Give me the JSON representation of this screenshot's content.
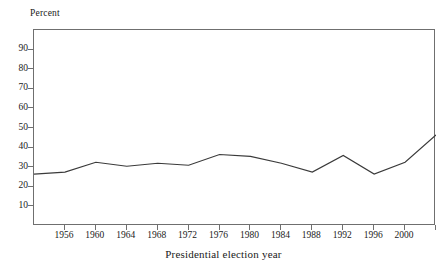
{
  "chart_data": {
    "type": "line",
    "title": "",
    "subtitle": "",
    "xlabel": "Presidential election year",
    "ylabel": "Percent",
    "y_unit_label": "Percent",
    "grid": false,
    "legend": false,
    "legend_position": "none",
    "xlim": [
      1952,
      2004
    ],
    "ylim": [
      0,
      100
    ],
    "x_ticks": [
      1956,
      1960,
      1964,
      1968,
      1972,
      1976,
      1980,
      1984,
      1988,
      1992,
      1996,
      2000
    ],
    "x_tick_labels": [
      "1956",
      "1960",
      "1964",
      "1968",
      "1972",
      "1976",
      "1980",
      "1984",
      "1988",
      "1992",
      "1996",
      "2000"
    ],
    "x_minor_ticks_unlabeled": [
      2004
    ],
    "y_ticks": [
      10,
      20,
      30,
      40,
      50,
      60,
      70,
      80,
      90
    ],
    "y_tick_labels": [
      "10",
      "20",
      "30",
      "40",
      "50",
      "60",
      "70",
      "80",
      "90"
    ],
    "x": [
      1952,
      1956,
      1960,
      1964,
      1968,
      1972,
      1976,
      1980,
      1984,
      1988,
      1992,
      1996,
      2000,
      2004
    ],
    "values": [
      26.5,
      27.5,
      32.5,
      30.5,
      32.0,
      31.0,
      36.5,
      35.5,
      32.0,
      27.5,
      36.0,
      26.5,
      32.5,
      46.5
    ],
    "series": [
      {
        "name": "Percent",
        "color": "#3a3a3a",
        "values": [
          26.5,
          27.5,
          32.5,
          30.5,
          32.0,
          31.0,
          36.5,
          35.5,
          32.0,
          27.5,
          36.0,
          26.5,
          32.5,
          46.5
        ]
      }
    ],
    "annotations": [],
    "axis_color": "#6f6f6f",
    "line_color": "#3a3a3a",
    "background_color": "#ffffff"
  }
}
